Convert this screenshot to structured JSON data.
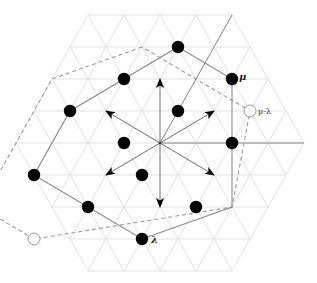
{
  "diagram": {
    "lattice": {
      "center": [
        160,
        143
      ],
      "unit_x": 36,
      "row_height": 32,
      "radius": 4,
      "grid_color": "#d9d9d9"
    },
    "walls": [
      {
        "from": [
          0,
          0
        ],
        "to": [
          4,
          0
        ]
      },
      {
        "from": [
          0,
          0
        ],
        "to": [
          0,
          4
        ]
      }
    ],
    "roots": [
      {
        "to": [
          1,
          1
        ],
        "name": "up-right-root"
      },
      {
        "to": [
          -1,
          2
        ],
        "name": "up-root"
      },
      {
        "to": [
          -2,
          1
        ],
        "name": "up-left-root"
      },
      {
        "to": [
          -1,
          -1
        ],
        "name": "down-left-root"
      },
      {
        "to": [
          1,
          -2
        ],
        "name": "down-root"
      },
      {
        "to": [
          2,
          -1
        ],
        "name": "down-right-root"
      }
    ],
    "weights_filled": [
      [
        -1,
        3
      ],
      [
        1,
        2
      ],
      [
        -2,
        2
      ],
      [
        -3,
        1
      ],
      [
        0,
        1
      ],
      [
        -1,
        0
      ],
      [
        2,
        0
      ],
      [
        -3,
        -1
      ],
      [
        0,
        -1
      ],
      [
        -1,
        -2
      ],
      [
        2,
        -2
      ],
      [
        1,
        -3
      ]
    ],
    "solid_hexagon": [
      [
        -1,
        3
      ],
      [
        1,
        2
      ],
      [
        3,
        -2
      ],
      [
        1,
        -3
      ],
      [
        -3,
        -1
      ],
      [
        -3,
        1
      ]
    ],
    "dashed_hexagon": [
      [
        -2,
        3
      ],
      [
        -4,
        2
      ],
      [
        -4,
        -2
      ],
      [
        -2,
        -3
      ],
      [
        3,
        -2
      ],
      [
        2,
        1
      ]
    ],
    "open_weights": [
      {
        "at": [
          2,
          1
        ],
        "label": "μ-λ",
        "name": "mu-minus-lambda"
      },
      {
        "at": [
          -2,
          -3
        ],
        "label": "λ",
        "name": "lambda"
      }
    ],
    "labels": {
      "mu": "μ",
      "mu_minus_lambda": "μ-λ",
      "lambda": "λ"
    },
    "colors": {
      "dot": "#000000",
      "open_dot_stroke": "#9a9a9a",
      "edges": "#8a8a8a",
      "arrows": "#000000"
    }
  }
}
